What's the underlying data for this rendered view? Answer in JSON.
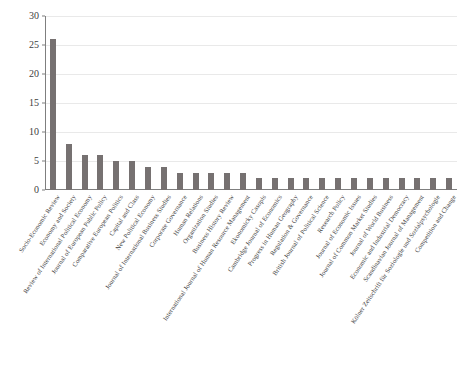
{
  "chart_data": {
    "type": "bar",
    "title": "",
    "subtitle": "",
    "xlabel": "",
    "ylabel": "",
    "ylim": [
      0,
      30
    ],
    "yticks": [
      0,
      5,
      10,
      15,
      20,
      25,
      30
    ],
    "grid": true,
    "legend": "none",
    "bar_color": "#767171",
    "categories": [
      "Socio-Economic Review",
      "Economy and Society",
      "Review of International Political Economy",
      "Journal of European Public Policy",
      "Comparative European Politics",
      "Capital and Class",
      "New Political Economy",
      "Journal of International Business Studies",
      "Corporate Governance",
      "Human Relations",
      "Organization Studies",
      "Business History Review",
      "International Journal of Human Resource Management",
      "Ekonomicky Casopis",
      "Cambridge Journal of Economics",
      "Progress in Human Geography",
      "Regulation & Governance",
      "British Journal of Political Science",
      "Research Policy",
      "Journal of Economic Issues",
      "Journal of Common Market Studies",
      "Journal of World Business",
      "Economic and Industrial Democracy",
      "Scandinavian Journal of Management",
      "Kölner Zeitschrift für Soziologie und Sozialpsychologie",
      "Competition and Change"
    ],
    "values": [
      26,
      8,
      6,
      6,
      5,
      5,
      4,
      4,
      3,
      3,
      3,
      3,
      3,
      2,
      2,
      2,
      2,
      2,
      2,
      2,
      2,
      2,
      2,
      2,
      2,
      2
    ]
  },
  "caption": {
    "text": ""
  }
}
